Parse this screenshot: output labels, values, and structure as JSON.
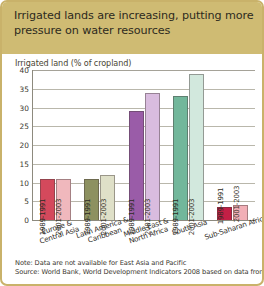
{
  "header": {
    "title": "Irrigated lands are increasing, putting more pressure on water resources",
    "band_color": "#cfbb73"
  },
  "axis_title": "Irrigated land (% of cropland)",
  "notes": {
    "note": "Note: Data are not available for East Asia and Pacific",
    "source": "Source: World Bank, World Development Indicators 2008 based on data from FAO"
  },
  "chart_data": {
    "type": "bar",
    "title": "Irrigated lands are increasing, putting more pressure on water resources",
    "subtitle": "Irrigated land (% of cropland)",
    "xlabel": "",
    "ylabel": "Irrigated land (% of cropland)",
    "ylim": [
      0,
      40
    ],
    "yticks": [
      0,
      5,
      10,
      15,
      20,
      25,
      30,
      35,
      40
    ],
    "ytick_labels": [
      "0",
      "5",
      "10",
      "15",
      "20",
      "25",
      "30",
      "35",
      "40"
    ],
    "grid": true,
    "legend": "none",
    "categories": [
      "Europe & Central Asia",
      "Latin America & Caribbean",
      "Middle East & North Africa",
      "South Asia",
      "Sub-Saharan Africa"
    ],
    "category_lines": [
      [
        "Europe &",
        "Central Asia"
      ],
      [
        "Latin America &",
        "Caribbean"
      ],
      [
        "Middle East &",
        "North Africa"
      ],
      [
        "South Asia"
      ],
      [
        "Sub-Saharan Africa"
      ]
    ],
    "series": [
      {
        "name": "1989-1991",
        "values": [
          11,
          11,
          29,
          33,
          3.5
        ]
      },
      {
        "name": "2001-2003",
        "values": [
          11,
          12,
          34,
          39,
          4
        ]
      }
    ],
    "bar_colors": [
      {
        "early": "#d4495c",
        "late": "#f0b8bd"
      },
      {
        "early": "#8d9160",
        "late": "#dfe0c8"
      },
      {
        "early": "#9a5ca8",
        "late": "#d9bcdf"
      },
      {
        "early": "#72b79b",
        "late": "#d2e8dd"
      },
      {
        "early": "#c31f45",
        "late": "#f2afb6"
      }
    ],
    "annotations": [
      "Note: Data are not available for East Asia and Pacific",
      "Source: World Bank, World Development Indicators 2008 based on data from FAO"
    ]
  }
}
